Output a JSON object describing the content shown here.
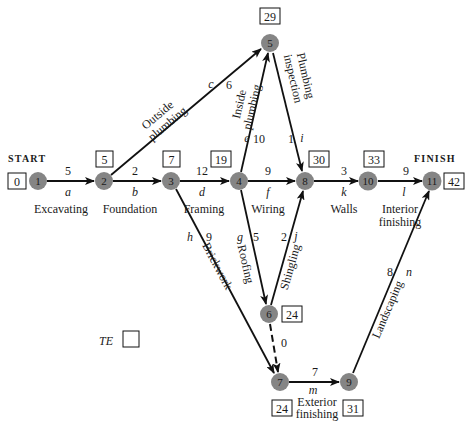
{
  "diagram": {
    "type": "PERT activity-on-arrow network",
    "start_label": "START",
    "finish_label": "FINISH",
    "legend": {
      "label": "TE",
      "box_value": ""
    },
    "nodes": [
      {
        "id": "1",
        "te": "0"
      },
      {
        "id": "2",
        "te": "5"
      },
      {
        "id": "3",
        "te": "7"
      },
      {
        "id": "4",
        "te": "19"
      },
      {
        "id": "5",
        "te": "29"
      },
      {
        "id": "6",
        "te": "24"
      },
      {
        "id": "7",
        "te": "24"
      },
      {
        "id": "8",
        "te": "30"
      },
      {
        "id": "9",
        "te": "31"
      },
      {
        "id": "10",
        "te": "33"
      },
      {
        "id": "11",
        "te": "42"
      }
    ],
    "activities": [
      {
        "from": "1",
        "to": "2",
        "letter": "a",
        "duration": "5",
        "name": "Excavating"
      },
      {
        "from": "2",
        "to": "3",
        "letter": "b",
        "duration": "2",
        "name": "Foundation"
      },
      {
        "from": "2",
        "to": "5",
        "letter": "c",
        "duration": "6",
        "name_line1": "Outside",
        "name_line2": "plumbing"
      },
      {
        "from": "3",
        "to": "4",
        "letter": "d",
        "duration": "12",
        "name": "Framing"
      },
      {
        "from": "4",
        "to": "5",
        "letter": "e",
        "duration": "10",
        "name_line1": "Inside",
        "name_line2": "plumbing"
      },
      {
        "from": "4",
        "to": "8",
        "letter": "f",
        "duration": "9",
        "name": "Wiring"
      },
      {
        "from": "4",
        "to": "6",
        "letter": "g",
        "duration": "5",
        "name": "Roofing"
      },
      {
        "from": "3",
        "to": "7",
        "letter": "h",
        "duration": "9",
        "name": "Brickwork"
      },
      {
        "from": "5",
        "to": "8",
        "letter": "i",
        "duration": "1",
        "name_line1": "Plumbing",
        "name_line2": "inspection"
      },
      {
        "from": "6",
        "to": "8",
        "letter": "j",
        "duration": "2",
        "name": "Shingling"
      },
      {
        "from": "8",
        "to": "10",
        "letter": "k",
        "duration": "3",
        "name": "Walls"
      },
      {
        "from": "10",
        "to": "11",
        "letter": "l",
        "duration": "9",
        "name_line1": "Interior",
        "name_line2": "finishing"
      },
      {
        "from": "7",
        "to": "9",
        "letter": "m",
        "duration": "7",
        "name_line1": "Exterior",
        "name_line2": "finishing"
      },
      {
        "from": "9",
        "to": "11",
        "letter": "n",
        "duration": "8",
        "name": "Landscaping"
      },
      {
        "from": "6",
        "to": "7",
        "letter": "",
        "duration": "0",
        "name": "",
        "dummy": true
      }
    ]
  }
}
